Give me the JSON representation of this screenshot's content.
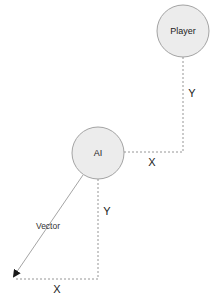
{
  "diagram": {
    "nodes": [
      {
        "id": "player",
        "label": "Player",
        "cx": 183,
        "cy": 31,
        "r": 26
      },
      {
        "id": "ai",
        "label": "AI",
        "cx": 98,
        "cy": 153,
        "r": 26
      }
    ],
    "upper_triangle": {
      "y_label": "Y",
      "x_label": "X"
    },
    "lower_triangle": {
      "vector_label": "Vector",
      "y_label": "Y",
      "x_label": "X"
    },
    "colors": {
      "node_fill": "#ececec",
      "node_stroke": "#9a9a9a",
      "line": "#8a8a8a",
      "arrow": "#1a1a1a",
      "text": "#222222"
    }
  }
}
